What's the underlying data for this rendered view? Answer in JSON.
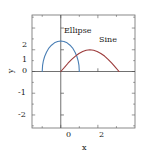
{
  "chart_data": {
    "type": "line",
    "title": "",
    "xlabel": "x",
    "ylabel": "y",
    "xlim": [
      -1.55,
      4.0
    ],
    "ylim": [
      -2.6,
      2.6
    ],
    "grid": false,
    "legend_position": "inline-annotations",
    "xticks": [
      0,
      2
    ],
    "xtick_labels": [
      "0",
      "2"
    ],
    "xminorticks": [
      -1,
      1,
      3
    ],
    "yticks": [
      2,
      1,
      0,
      -1,
      -2
    ],
    "ytick_labels": [
      "2",
      "1",
      "0",
      "-1",
      "-2"
    ],
    "yminorticks": [
      2.5,
      1.5,
      0.5,
      -0.5,
      -1.5,
      -2.5
    ],
    "series": [
      {
        "name": "Ellipse",
        "color": "#4a7fb5",
        "x": [
          -1.0,
          -0.98,
          -0.94,
          -0.87,
          -0.77,
          -0.64,
          -0.5,
          -0.34,
          -0.17,
          0.0,
          0.17,
          0.34,
          0.5,
          0.64,
          0.77,
          0.87,
          0.94,
          0.98,
          1.0
        ],
        "y": [
          0.0,
          0.28,
          0.48,
          0.69,
          0.89,
          1.08,
          1.21,
          1.32,
          1.38,
          1.4,
          1.38,
          1.32,
          1.21,
          1.08,
          0.89,
          0.69,
          0.48,
          0.28,
          0.0
        ]
      },
      {
        "name": "Sine",
        "color": "#9c3b3b",
        "x": [
          0.0,
          0.2,
          0.39,
          0.59,
          0.79,
          0.98,
          1.18,
          1.37,
          1.57,
          1.77,
          1.96,
          2.16,
          2.36,
          2.55,
          2.75,
          2.95,
          3.14
        ],
        "y": [
          0.0,
          0.19,
          0.38,
          0.56,
          0.71,
          0.83,
          0.92,
          0.98,
          1.0,
          0.98,
          0.92,
          0.83,
          0.71,
          0.56,
          0.38,
          0.19,
          0.0
        ]
      }
    ],
    "annotations": [
      {
        "text": "Ellipse",
        "x": 0.08,
        "y": 1.75
      },
      {
        "text": "Sine",
        "x": 2.0,
        "y": 1.35
      }
    ]
  },
  "axes": {
    "x_title": "x",
    "y_title": "y"
  },
  "colors": {
    "ellipse": "#4a7fb5",
    "sine": "#9c3b3b",
    "frame": "#6b6b6b",
    "axis_line": "#4d4d4d",
    "background": "#ffffff"
  }
}
